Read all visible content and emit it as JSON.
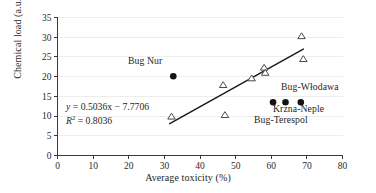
{
  "chart_data": {
    "type": "scatter",
    "title": "",
    "xlabel": "Average toxicity (%)",
    "ylabel": "Chemical load (a.u.)",
    "xlim": [
      0,
      80
    ],
    "ylim": [
      0,
      35
    ],
    "xticks": [
      0,
      10,
      20,
      30,
      40,
      50,
      60,
      70,
      80
    ],
    "yticks": [
      0,
      5,
      10,
      15,
      20,
      25,
      30,
      35
    ],
    "grid": "horizontal",
    "legend": "none",
    "series": [
      {
        "name": "open-triangles",
        "marker": "triangle-open",
        "points": [
          {
            "x": 32.0,
            "y": 9.9
          },
          {
            "x": 46.5,
            "y": 17.9
          },
          {
            "x": 47.0,
            "y": 10.3
          },
          {
            "x": 54.5,
            "y": 19.6
          },
          {
            "x": 58.0,
            "y": 22.3
          },
          {
            "x": 58.3,
            "y": 21.0
          },
          {
            "x": 68.5,
            "y": 30.3
          },
          {
            "x": 69.0,
            "y": 24.5
          }
        ]
      },
      {
        "name": "filled-circles",
        "marker": "circle-filled",
        "points": [
          {
            "x": 32.5,
            "y": 20.1,
            "label": "Bug Nur"
          },
          {
            "x": 60.5,
            "y": 13.5,
            "label": "Bug-Terespol"
          },
          {
            "x": 64.0,
            "y": 13.5,
            "label": "Krzna-Neple"
          },
          {
            "x": 68.3,
            "y": 13.5,
            "label": "Bug-Włodawa"
          }
        ]
      }
    ],
    "trendline": {
      "slope": 0.5036,
      "intercept": -7.7706,
      "x_start": 31.5,
      "x_end": 69.0,
      "equation": "y = 0.5036x − 7.7706",
      "r_squared_label": "R² = 0.8036",
      "r_squared": 0.8036
    },
    "annotations": [
      {
        "name": "bug-nur",
        "text": "Bug Nur"
      },
      {
        "name": "bug-wlodawa",
        "text": "Bug-Włodawa"
      },
      {
        "name": "krzna-neple",
        "text": "Krzna-Neple"
      },
      {
        "name": "bug-terespol",
        "text": "Bug-Terespol"
      }
    ]
  },
  "axes": {
    "x_title": "Average toxicity (%)",
    "y_title": "Chemical load (a.u.)",
    "x_tick_labels": [
      "0",
      "10",
      "20",
      "30",
      "40",
      "50",
      "60",
      "70",
      "80"
    ],
    "y_tick_labels": [
      "0",
      "5",
      "10",
      "15",
      "20",
      "25",
      "30",
      "35"
    ]
  },
  "equation": {
    "slope_term": "0.5036x",
    "intercept_term": "7.7706",
    "r2_value": "0.8036",
    "full": "y = 0.5036x − 7.7706",
    "r2_full": "R2 = 0.8036"
  },
  "labels": {
    "bug_nur": "Bug Nur",
    "bug_wlodawa": "Bug-Włodawa",
    "krzna_neple": "Krzna-Neple",
    "bug_terespol": "Bug-Terespol"
  },
  "colors": {
    "axis": "#3a3a3a",
    "grid": "#e8e8e8",
    "trendline": "#1a1a1a",
    "marker_fill": "#141414",
    "marker_outline": "#4a4a4a",
    "text": "#231f20",
    "background": "#ffffff"
  }
}
